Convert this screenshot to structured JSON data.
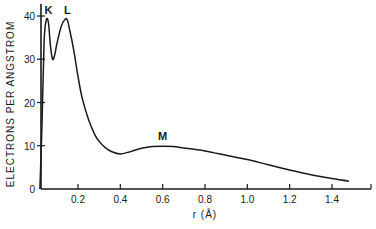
{
  "chart_data": {
    "type": "line",
    "title": "",
    "xlabel": "r (Å)",
    "ylabel": "ELECTRONS PER ANGSTROM",
    "xlim": [
      0.02,
      1.6
    ],
    "ylim": [
      0,
      40
    ],
    "grid": false,
    "legend": null,
    "x_ticks": [
      0.2,
      0.4,
      0.6,
      0.8,
      1.0,
      1.2,
      1.4
    ],
    "x_tick_labels": [
      "0.2",
      "0.4",
      "0.6",
      "0.8",
      "1.0",
      "1.2",
      "1.4"
    ],
    "y_ticks": [
      0,
      10,
      20,
      30,
      40
    ],
    "y_tick_labels": [
      "0",
      "10",
      "20",
      "30",
      "40"
    ],
    "annotations": [
      {
        "text": "K",
        "x": 0.06,
        "y": 39
      },
      {
        "text": "L",
        "x": 0.15,
        "y": 39
      },
      {
        "text": "M",
        "x": 0.6,
        "y": 10
      }
    ],
    "series": [
      {
        "name": "radial electron density",
        "x": [
          0.02,
          0.03,
          0.04,
          0.05,
          0.06,
          0.07,
          0.08,
          0.09,
          0.1,
          0.12,
          0.14,
          0.15,
          0.16,
          0.18,
          0.2,
          0.22,
          0.25,
          0.28,
          0.3,
          0.33,
          0.36,
          0.4,
          0.45,
          0.5,
          0.55,
          0.6,
          0.65,
          0.7,
          0.8,
          0.9,
          1.0,
          1.1,
          1.2,
          1.3,
          1.4,
          1.48
        ],
        "y": [
          0,
          15,
          34,
          39,
          38.5,
          33,
          30,
          31,
          33.5,
          37.5,
          39.3,
          39,
          37,
          32,
          26,
          21,
          16,
          12.5,
          11,
          9.5,
          8.6,
          8.1,
          8.7,
          9.4,
          9.8,
          9.9,
          9.8,
          9.5,
          8.8,
          7.8,
          6.8,
          5.6,
          4.4,
          3.3,
          2.4,
          1.8
        ]
      }
    ]
  }
}
